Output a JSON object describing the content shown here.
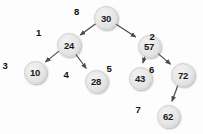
{
  "diagram": {
    "type": "binary-tree",
    "background_color": "#fdfdfd",
    "node_fill_color": "#e6e6e6",
    "node_border_color": "#d0d0d0",
    "edge_color": "#4a4a4a",
    "text_color": "#1a1a1a"
  },
  "nodes": [
    {
      "id": "n8",
      "key": "30",
      "index": "8",
      "cx": 105,
      "cy": 17,
      "r": 11,
      "index_dx": -20,
      "index_dy": -6
    },
    {
      "id": "n1",
      "key": "24",
      "index": "1",
      "cx": 68,
      "cy": 44,
      "r": 11,
      "index_dx": -21,
      "index_dy": -12
    },
    {
      "id": "n3",
      "key": "10",
      "index": "3",
      "cx": 34,
      "cy": 71,
      "r": 10.5,
      "index_dx": -21,
      "index_dy": -6
    },
    {
      "id": "n4",
      "key": "28",
      "index": "4",
      "cx": 95,
      "cy": 80,
      "r": 10.5,
      "index_dx": -21,
      "index_dy": -6
    },
    {
      "id": "n2",
      "key": "57",
      "index": "2",
      "cx": 148,
      "cy": 45,
      "r": 10.5,
      "index_dx": 12,
      "index_dy": -9
    },
    {
      "id": "n5",
      "key": "43",
      "index": "5",
      "cx": 139,
      "cy": 77,
      "r": 10.5,
      "index_dx": -22,
      "index_dy": -9
    },
    {
      "id": "n6",
      "key": "72",
      "index": "6",
      "cx": 182,
      "cy": 74,
      "r": 11,
      "index_dx": -22,
      "index_dy": -5
    },
    {
      "id": "n7",
      "key": "62",
      "index": "7",
      "cx": 167,
      "cy": 115,
      "r": 10.5,
      "index_dx": -21,
      "index_dy": -6
    }
  ],
  "edges": [
    {
      "from": "n8",
      "to": "n1",
      "label": ""
    },
    {
      "from": "n8",
      "to": "n2",
      "label": ""
    },
    {
      "from": "n1",
      "to": "n3",
      "label": ""
    },
    {
      "from": "n1",
      "to": "n4",
      "label": ""
    },
    {
      "from": "n2",
      "to": "n5",
      "label": ""
    },
    {
      "from": "n2",
      "to": "n6",
      "label": ""
    },
    {
      "from": "n6",
      "to": "n7",
      "label": ""
    }
  ]
}
